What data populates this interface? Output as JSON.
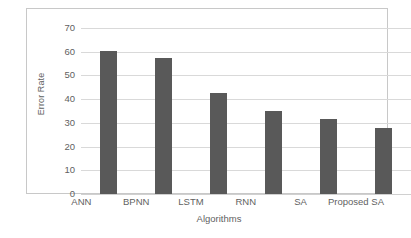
{
  "chart_data": {
    "type": "bar",
    "title": "",
    "subtitle": "",
    "xlabel": "Algorithms",
    "ylabel": "Error Rate",
    "categories": [
      "ANN",
      "BPNN",
      "LSTM",
      "RNN",
      "SA",
      "Proposed SA"
    ],
    "values": [
      60.5,
      57.5,
      42.5,
      35,
      31.5,
      28
    ],
    "ylim": [
      0,
      70
    ],
    "yticks": [
      0,
      10,
      20,
      30,
      40,
      50,
      60,
      70
    ],
    "ytick_labels": [
      "0",
      "10",
      "20",
      "30",
      "40",
      "50",
      "60",
      "70"
    ],
    "grid": "horizontal",
    "legend": "none",
    "bar_color": "#595959",
    "gridline_color": "#d9d9d9",
    "frame_color": "#c8c8c8",
    "text_color": "#5f5f5f",
    "background": "#ffffff",
    "annotations": []
  }
}
